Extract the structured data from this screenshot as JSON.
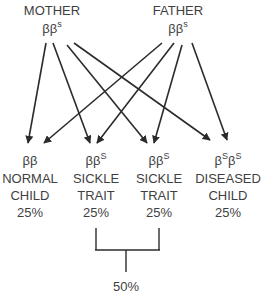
{
  "parents": {
    "mother": {
      "label": "MOTHER",
      "genotype_base": "ββ",
      "genotype_sup": "s"
    },
    "father": {
      "label": "FATHER",
      "genotype_base": "ββ",
      "genotype_sup": "s"
    }
  },
  "children": [
    {
      "genotype_a": "ββ",
      "genotype_a_sup": "",
      "genotype_b": "",
      "genotype_b_sup": "",
      "line1": "NORMAL",
      "line2": "CHILD",
      "percent": "25%"
    },
    {
      "genotype_a": "ββ",
      "genotype_a_sup": "S",
      "genotype_b": "",
      "genotype_b_sup": "",
      "line1": "SICKLE",
      "line2": "TRAIT",
      "percent": "25%"
    },
    {
      "genotype_a": "ββ",
      "genotype_a_sup": "S",
      "genotype_b": "",
      "genotype_b_sup": "",
      "line1": "SICKLE",
      "line2": "TRAIT",
      "percent": "25%"
    },
    {
      "genotype_a": "β",
      "genotype_a_sup": "S",
      "genotype_b": "β",
      "genotype_b_sup": "S",
      "line1": "DISEASED",
      "line2": "CHILD",
      "percent": "25%"
    }
  ],
  "combined": {
    "percent": "50%"
  },
  "colors": {
    "line": "#2b2b2b",
    "text": "#3f3f3f"
  }
}
